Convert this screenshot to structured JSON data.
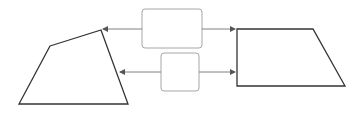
{
  "canvas": {
    "width": 354,
    "height": 114,
    "background": "#ffffff"
  },
  "colors": {
    "shape_stroke": "#333333",
    "box_stroke": "#a6a6a6",
    "arrow_stroke": "#808080",
    "arrow_head": "#555555"
  },
  "shapes": {
    "left_quad": {
      "points": "50,46 101,30 128,104 19,104"
    },
    "right_trapezoid": {
      "points": "237,29 313,29 345,86 237,86"
    }
  },
  "boxes": [
    {
      "id": "top-box",
      "x": 142,
      "y": 9,
      "width": 60,
      "height": 39,
      "rx": 3
    },
    {
      "id": "bottom-box",
      "x": 161,
      "y": 53,
      "width": 38,
      "height": 38,
      "rx": 3
    }
  ],
  "arrows": [
    {
      "id": "top-box-to-left",
      "x1": 142,
      "y1": 29,
      "x2": 103,
      "y2": 29
    },
    {
      "id": "top-box-to-right",
      "x1": 202,
      "y1": 29,
      "x2": 235,
      "y2": 29
    },
    {
      "id": "bottom-box-to-left",
      "x1": 161,
      "y1": 72,
      "x2": 120,
      "y2": 72
    },
    {
      "id": "bottom-box-to-right",
      "x1": 199,
      "y1": 72,
      "x2": 235,
      "y2": 72
    }
  ]
}
